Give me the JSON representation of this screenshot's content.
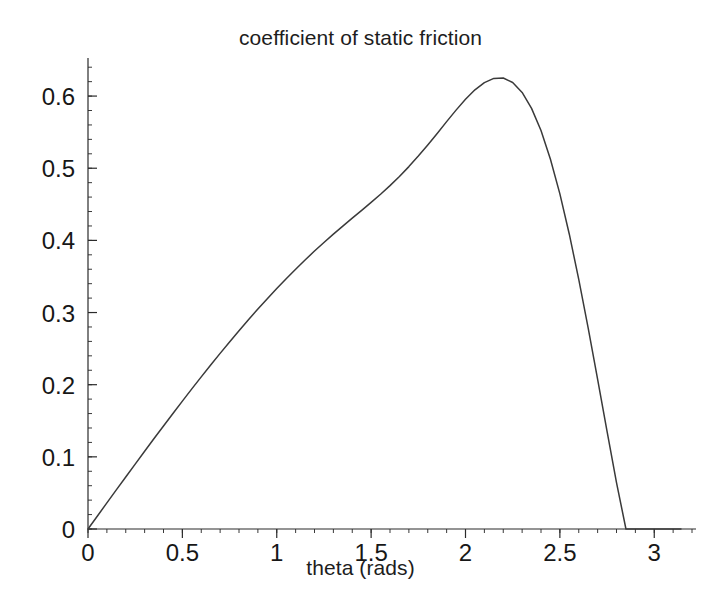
{
  "figure": {
    "background_color": "#ffffff",
    "title": "coefficient of static friction",
    "xaxis_label": "theta (rads)"
  },
  "chart_data": {
    "type": "line",
    "title": "coefficient of static friction",
    "xlabel": "theta (rads)",
    "ylabel": "",
    "xlim": [
      0,
      3.2
    ],
    "ylim": [
      0,
      0.65
    ],
    "grid": false,
    "legend": null,
    "line_color": "#3a3a3a",
    "x_ticks": [
      0,
      0.5,
      1,
      1.5,
      2,
      2.5,
      3
    ],
    "x_tick_labels": [
      "0",
      "0.5",
      "1",
      "1.5",
      "2",
      "2.5",
      "3"
    ],
    "x_minor_tick_step": 0.1,
    "y_ticks": [
      0,
      0.1,
      0.2,
      0.3,
      0.4,
      0.5,
      0.6
    ],
    "y_tick_labels": [
      "0",
      "0.1",
      "0.2",
      "0.3",
      "0.4",
      "0.5",
      "0.6"
    ],
    "y_minor_tick_step": 0.02,
    "peak": {
      "x": 2.12,
      "y": 0.625
    },
    "series": [
      {
        "name": "coefficient of static friction",
        "x": [
          0.0,
          0.05,
          0.1,
          0.15,
          0.2,
          0.25,
          0.3,
          0.35,
          0.4,
          0.45,
          0.5,
          0.55,
          0.6,
          0.65,
          0.7,
          0.75,
          0.8,
          0.85,
          0.9,
          0.95,
          1.0,
          1.05,
          1.1,
          1.15,
          1.2,
          1.25,
          1.3,
          1.35,
          1.4,
          1.45,
          1.5,
          1.55,
          1.6,
          1.65,
          1.7,
          1.75,
          1.8,
          1.85,
          1.9,
          1.95,
          2.0,
          2.05,
          2.1,
          2.15,
          2.2,
          2.25,
          2.3,
          2.35,
          2.4,
          2.45,
          2.5,
          2.55,
          2.6,
          2.65,
          2.7,
          2.75,
          2.8,
          2.85,
          2.9,
          2.95,
          3.0,
          3.05,
          3.1,
          3.1416
        ],
        "y": [
          0.0,
          0.0155,
          0.031,
          0.0464,
          0.0618,
          0.0771,
          0.0923,
          0.1074,
          0.1224,
          0.1372,
          0.1519,
          0.1664,
          0.1807,
          0.1948,
          0.2086,
          0.2222,
          0.2355,
          0.2485,
          0.2612,
          0.2736,
          0.2856,
          0.2973,
          0.3086,
          0.3195,
          0.3301,
          0.3403,
          0.3502,
          0.3598,
          0.3692,
          0.3785,
          0.3879,
          0.3976,
          0.4078,
          0.4187,
          0.4304,
          0.4429,
          0.4561,
          0.4698,
          0.4838,
          0.4975,
          0.5104,
          0.5216,
          0.5302,
          0.5352,
          0.5356,
          0.5303,
          0.5185,
          0.4996,
          0.4732,
          0.4392,
          0.398,
          0.3501,
          0.2965,
          0.2385,
          0.1777,
          0.1159,
          0.0552,
          0.0,
          0.0,
          0.0,
          0.0,
          0.0,
          0.0,
          0.0
        ]
      }
    ],
    "series_normalized_note": "values shown on axis reach a maximum of 0.625 at theta = 2.12"
  },
  "plot_geometry": {
    "left_px": 88,
    "right_px": 692,
    "top_px": 60,
    "bottom_px": 529
  }
}
